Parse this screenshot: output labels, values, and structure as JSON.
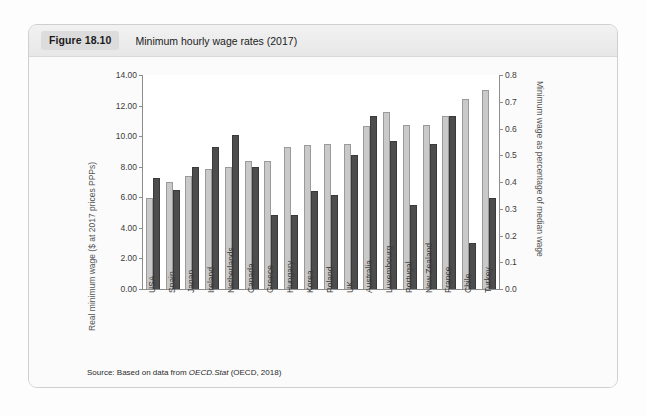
{
  "figure": {
    "badge": "Figure 18.10",
    "title": "Minimum hourly wage rates (2017)",
    "source_prefix": "Source: Based on data from ",
    "source_italic": "OECD.Stat",
    "source_suffix": " (OECD, 2018)"
  },
  "chart_data": {
    "type": "bar",
    "title": "Minimum hourly wage rates (2017)",
    "xlabel": "",
    "ylabel": "Real minimum wage ($ at 2017 prices PPPs)",
    "ylabel_right": "Minimum wage as percentage of median wage",
    "ylim": [
      0,
      14
    ],
    "ylim_right": [
      0,
      0.8
    ],
    "yticks": [
      "0.00",
      "2.00",
      "4.00",
      "6.00",
      "8.00",
      "10.00",
      "12.00",
      "14.00"
    ],
    "yticks_right": [
      "0.0",
      "0.1",
      "0.2",
      "0.3",
      "0.4",
      "0.5",
      "0.6",
      "0.7",
      "0.8"
    ],
    "grid": false,
    "legend": "none",
    "categories": [
      "USA",
      "Spain",
      "Japan",
      "Ireland",
      "Netherlands",
      "Canada",
      "Greece",
      "Hungary",
      "Korea",
      "Poland",
      "UK",
      "Australia",
      "Luxembourg",
      "Portugal",
      "New Zealand",
      "France",
      "Chile",
      "Turkey"
    ],
    "series": [
      {
        "name": "Real minimum wage ($ at 2017 prices PPPs)",
        "axis": "left",
        "color": "#c9c9c9",
        "values": [
          5.95,
          7.0,
          7.4,
          7.85,
          8.0,
          8.35,
          8.4,
          9.3,
          9.4,
          9.5,
          9.5,
          10.65,
          11.6,
          10.7,
          10.7,
          11.3,
          12.4,
          13.0
        ]
      },
      {
        "name": "Minimum wage as percentage of median wage",
        "axis": "right",
        "color": "#4d4d4d",
        "values": [
          0.415,
          0.372,
          0.458,
          0.53,
          0.575,
          0.455,
          0.277,
          0.277,
          0.367,
          0.35,
          0.5,
          0.648,
          0.553,
          0.315,
          0.543,
          0.648,
          0.172,
          0.34
        ]
      }
    ],
    "series_right_in_dollars": [
      7.27,
      6.5,
      8.0,
      9.28,
      10.05,
      7.95,
      4.85,
      4.85,
      6.42,
      6.12,
      8.75,
      11.35,
      9.68,
      5.5,
      9.5,
      11.35,
      3.0,
      5.95
    ]
  }
}
